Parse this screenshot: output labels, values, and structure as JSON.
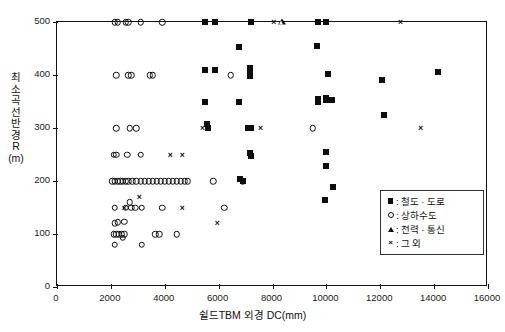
{
  "chart_data": {
    "type": "scatter",
    "title": "",
    "xlabel": "쉴드TBM 외경  DC(mm)",
    "ylabel": "최소 곡선반경 R (m)",
    "ylabel_chars": "최소 곡선반경 R (m)",
    "xlim": [
      0,
      16000
    ],
    "ylim": [
      0,
      500
    ],
    "xticks": [
      0,
      2000,
      4000,
      6000,
      8000,
      10000,
      12000,
      14000,
      16000
    ],
    "yticks": [
      0,
      100,
      200,
      300,
      400,
      500
    ],
    "grid": false,
    "legend_position": "inside-bottom-right",
    "series": [
      {
        "name": "철도·도로",
        "marker": "square",
        "color": "#0d0d0d",
        "points": [
          [
            5500,
            500
          ],
          [
            5850,
            500
          ],
          [
            7200,
            500
          ],
          [
            9700,
            500
          ],
          [
            10000,
            500
          ],
          [
            6750,
            452
          ],
          [
            5500,
            410
          ],
          [
            5850,
            410
          ],
          [
            7150,
            413
          ],
          [
            7150,
            404
          ],
          [
            7150,
            398
          ],
          [
            9650,
            455
          ],
          [
            10050,
            402
          ],
          [
            5500,
            350
          ],
          [
            6750,
            350
          ],
          [
            9700,
            355
          ],
          [
            9700,
            350
          ],
          [
            10000,
            357
          ],
          [
            10000,
            352
          ],
          [
            10200,
            352
          ],
          [
            5550,
            308
          ],
          [
            5600,
            300
          ],
          [
            7100,
            300
          ],
          [
            7200,
            300
          ],
          [
            7150,
            252
          ],
          [
            7200,
            247
          ],
          [
            6800,
            203
          ],
          [
            6900,
            200
          ],
          [
            10000,
            255
          ],
          [
            10000,
            228
          ],
          [
            10250,
            188
          ],
          [
            9950,
            165
          ],
          [
            12050,
            390
          ],
          [
            12150,
            325
          ],
          [
            14150,
            405
          ]
        ]
      },
      {
        "name": "상하수도",
        "marker": "circle",
        "color": "#0d0d0d",
        "points": [
          [
            2150,
            500
          ],
          [
            2250,
            500
          ],
          [
            2550,
            500
          ],
          [
            2650,
            500
          ],
          [
            3100,
            500
          ],
          [
            3900,
            500
          ],
          [
            2200,
            400
          ],
          [
            2650,
            400
          ],
          [
            2750,
            400
          ],
          [
            3450,
            400
          ],
          [
            3550,
            400
          ],
          [
            2200,
            300
          ],
          [
            2700,
            300
          ],
          [
            2950,
            300
          ],
          [
            6450,
            400
          ],
          [
            9500,
            300
          ],
          [
            2100,
            250
          ],
          [
            2200,
            250
          ],
          [
            2600,
            250
          ],
          [
            3100,
            250
          ],
          [
            2050,
            200
          ],
          [
            2150,
            200
          ],
          [
            2250,
            200
          ],
          [
            2350,
            200
          ],
          [
            2450,
            200
          ],
          [
            2550,
            200
          ],
          [
            2650,
            200
          ],
          [
            2800,
            200
          ],
          [
            2950,
            200
          ],
          [
            3100,
            200
          ],
          [
            3250,
            200
          ],
          [
            3400,
            200
          ],
          [
            3550,
            200
          ],
          [
            3700,
            200
          ],
          [
            3850,
            200
          ],
          [
            4000,
            200
          ],
          [
            4150,
            200
          ],
          [
            4300,
            200
          ],
          [
            4450,
            200
          ],
          [
            4600,
            200
          ],
          [
            4750,
            200
          ],
          [
            4850,
            200
          ],
          [
            5800,
            200
          ],
          [
            6900,
            200
          ],
          [
            2150,
            150
          ],
          [
            2550,
            150
          ],
          [
            2700,
            160
          ],
          [
            2750,
            150
          ],
          [
            2900,
            150
          ],
          [
            3150,
            150
          ],
          [
            3900,
            150
          ],
          [
            6200,
            150
          ],
          [
            2150,
            120
          ],
          [
            2250,
            122
          ],
          [
            2500,
            123
          ],
          [
            2100,
            100
          ],
          [
            2200,
            100
          ],
          [
            2300,
            100
          ],
          [
            2400,
            100
          ],
          [
            2500,
            100
          ],
          [
            2450,
            93
          ],
          [
            3650,
            100
          ],
          [
            3800,
            100
          ],
          [
            4450,
            100
          ],
          [
            2150,
            80
          ],
          [
            3150,
            80
          ]
        ]
      },
      {
        "name": "전력·통신",
        "marker": "triangle",
        "color": "#0d0d0d",
        "points": [
          [
            8200,
            500
          ]
        ]
      },
      {
        "name": "그 외",
        "marker": "cross",
        "color": "#0d0d0d",
        "points": [
          [
            8050,
            500
          ],
          [
            12750,
            500
          ],
          [
            5400,
            300
          ],
          [
            7550,
            300
          ],
          [
            13500,
            300
          ],
          [
            4200,
            250
          ],
          [
            4650,
            250
          ],
          [
            3050,
            170
          ],
          [
            2500,
            150
          ],
          [
            4650,
            150
          ],
          [
            5950,
            120
          ]
        ]
      }
    ]
  },
  "legend": {
    "items": [
      {
        "marker": "square",
        "separator": ":",
        "label": "철도 · 도로"
      },
      {
        "marker": "circle",
        "separator": ":",
        "label": "상하수도"
      },
      {
        "marker": "triangle",
        "separator": ":",
        "label": "전력 · 통신"
      },
      {
        "marker": "cross",
        "separator": ":",
        "label": "그 외"
      }
    ]
  }
}
